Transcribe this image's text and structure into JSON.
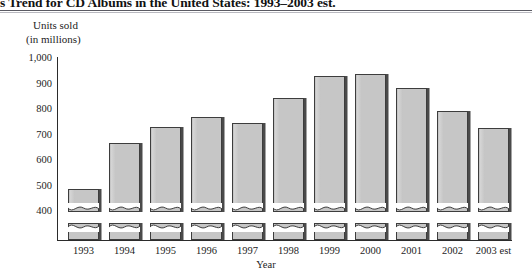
{
  "figure": {
    "title": "s Trend for CD Albums in the United States: 1993–2003 est.",
    "caption_line_1": "Units sold",
    "caption_line_2": "(in millions)",
    "axis_title_x": "Year"
  },
  "colors": {
    "bar_fill": "#c6c6c6",
    "bar_outline": "#3d3d3d",
    "bar_shadow": "#4a4a4a",
    "axis": "#2b2b2b",
    "text": "#1d1d1d",
    "rule": "#5b5b63"
  },
  "y_axis": {
    "ticks": [
      "1,000",
      "900",
      "800",
      "700",
      "600",
      "500",
      "400"
    ],
    "tick_positions_px": [
      58,
      83.5,
      109,
      134.5,
      160,
      185.5,
      211
    ],
    "broken_axis": true
  },
  "bars": [
    {
      "label": "1993",
      "value": 495,
      "x": 68,
      "width": 31,
      "top": 189
    },
    {
      "label": "1994",
      "value": 675,
      "x": 109,
      "width": 31,
      "top": 143
    },
    {
      "label": "1995",
      "value": 740,
      "x": 150,
      "width": 31,
      "top": 127
    },
    {
      "label": "1996",
      "value": 780,
      "x": 191,
      "width": 31,
      "top": 117
    },
    {
      "label": "1997",
      "value": 755,
      "x": 232,
      "width": 31,
      "top": 123
    },
    {
      "label": "1998",
      "value": 855,
      "x": 273,
      "width": 31,
      "top": 98
    },
    {
      "label": "1999",
      "value": 940,
      "x": 314,
      "width": 31,
      "top": 76
    },
    {
      "label": "2000",
      "value": 950,
      "x": 355,
      "width": 31,
      "top": 74
    },
    {
      "label": "2001",
      "value": 895,
      "x": 396,
      "width": 31,
      "top": 88
    },
    {
      "label": "2002",
      "value": 805,
      "x": 437,
      "width": 31,
      "top": 111
    },
    {
      "label": "2003 est",
      "value": 735,
      "x": 478,
      "width": 31,
      "top": 128
    }
  ],
  "chart_data": {
    "type": "bar",
    "title": "s Trend for CD Albums in the United States: 1993–2003 est.",
    "xlabel": "Year",
    "ylabel": "Units sold (in millions)",
    "categories": [
      "1993",
      "1994",
      "1995",
      "1996",
      "1997",
      "1998",
      "1999",
      "2000",
      "2001",
      "2002",
      "2003 est"
    ],
    "values": [
      495,
      675,
      740,
      780,
      755,
      855,
      940,
      950,
      895,
      805,
      735
    ],
    "ytick_labels": [
      "400",
      "500",
      "600",
      "700",
      "800",
      "900",
      "1,000"
    ],
    "ytick_values": [
      400,
      500,
      600,
      700,
      800,
      900,
      1000
    ],
    "ylim": [
      0,
      1000
    ],
    "axis_break": true,
    "axis_break_note": "Bars are drawn with a wavy break near the baseline; y-axis labels start at 400.",
    "grid": false,
    "legend": null,
    "series": [
      {
        "name": "CD albums sold (millions)",
        "values": [
          495,
          675,
          740,
          780,
          755,
          855,
          940,
          950,
          895,
          805,
          735
        ]
      }
    ]
  }
}
